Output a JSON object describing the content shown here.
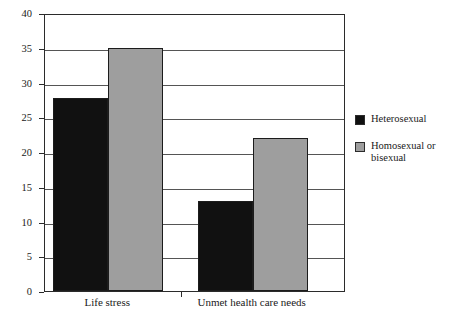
{
  "chart_data": {
    "type": "bar",
    "title": "",
    "subtitle": "",
    "xlabel": "",
    "ylabel": "",
    "categories": [
      "Life stress",
      "Unmet health care needs"
    ],
    "series": [
      {
        "name": "Heterosexual",
        "values": [
          27.8,
          13
        ],
        "color": "#111111"
      },
      {
        "name": "Homosexual or bisexual",
        "values": [
          35,
          22
        ],
        "color": "#9e9e9e"
      }
    ],
    "ylim": [
      0,
      40
    ],
    "ytick_labels": [
      "0",
      "5",
      "10",
      "15",
      "20",
      "25",
      "30",
      "35",
      "40"
    ],
    "ytick_values": [
      0,
      5,
      10,
      15,
      20,
      25,
      30,
      35,
      40
    ],
    "grid": true,
    "legend_position": "right",
    "frame_color": "#2b2b2b",
    "grid_color": "#555555",
    "background": "#ffffff"
  }
}
